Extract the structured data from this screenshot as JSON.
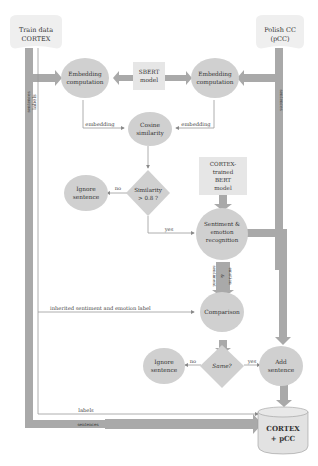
{
  "colors": {
    "node_fill": "#d0d0d0",
    "box_fill": "#e6e6e6",
    "pipe": "#a9a9a9",
    "thin_line": "#9a9a9a",
    "text": "#333333"
  },
  "sources": {
    "train": {
      "line1": "Train data",
      "line2": "CORTEX"
    },
    "polish": {
      "line1": "Polish CC",
      "line2": "(pCC)"
    }
  },
  "nodes": {
    "embed_left": {
      "line1": "Embedding",
      "line2": "computation"
    },
    "sbert": {
      "line1": "SBERT",
      "line2": "model"
    },
    "embed_right": {
      "line1": "Embedding",
      "line2": "computation"
    },
    "cosine": {
      "line1": "Cosine",
      "line2": "similarity"
    },
    "similarity_check": {
      "line1": "Similarity",
      "line2": "> 0.8 ?"
    },
    "ignore1": {
      "line1": "Ignore",
      "line2": "sentence"
    },
    "bert": {
      "line1": "CORTEX-",
      "line2": "trained",
      "line3": "BERT",
      "line4": "model"
    },
    "recognition": {
      "line1": "Sentiment &",
      "line2": "emotion",
      "line3": "recognition"
    },
    "comparison": {
      "label": "Comparison"
    },
    "same_check": {
      "label": "Same?"
    },
    "ignore2": {
      "line1": "Ignore",
      "line2": "sentence"
    },
    "add": {
      "line1": "Add",
      "line2": "sentence"
    },
    "output": {
      "line1": "CORTEX",
      "line2": "+ pCC"
    }
  },
  "edges": {
    "sentences_left": "sentences",
    "labels_left": "labels",
    "sentences_right": "sentences",
    "embedding_left": "embedding",
    "embedding_right": "embedding",
    "no1": "no",
    "yes1": "yes",
    "sentiment": "sentiment",
    "amp": "&",
    "emotion": "emotion",
    "inherited": "inherited sentiment and emotion label",
    "no2": "no",
    "yes2": "yes",
    "labels_bottom": "labels",
    "sentences_bottom": "sentences"
  }
}
